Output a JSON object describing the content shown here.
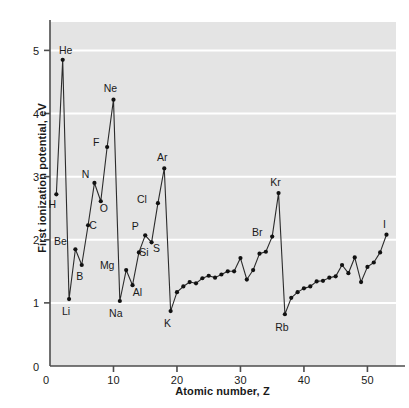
{
  "chart_data": {
    "type": "line",
    "title": "",
    "xlabel": "Atomic number, Z",
    "ylabel": "First ionization potential, eV",
    "xlim": [
      0,
      54.5
    ],
    "ylim": [
      0,
      5.45
    ],
    "xticks": [
      0,
      10,
      20,
      30,
      40,
      50
    ],
    "yticks": [
      0,
      1,
      2,
      3,
      4,
      5
    ],
    "gridlines": "horizontal-white",
    "legend": "none",
    "marker": "filled-circle",
    "x": [
      1,
      2,
      3,
      4,
      5,
      6,
      7,
      8,
      9,
      10,
      11,
      12,
      13,
      14,
      15,
      16,
      17,
      18,
      19,
      20,
      21,
      22,
      23,
      24,
      25,
      26,
      27,
      28,
      29,
      30,
      31,
      32,
      33,
      34,
      35,
      36,
      37,
      38,
      39,
      40,
      41,
      42,
      43,
      44,
      45,
      46,
      47,
      48,
      49,
      50,
      51,
      52,
      53
    ],
    "y": [
      2.72,
      4.85,
      1.06,
      1.85,
      1.6,
      2.23,
      2.9,
      2.61,
      3.47,
      4.22,
      1.03,
      1.52,
      1.28,
      1.8,
      2.07,
      1.96,
      2.58,
      3.13,
      0.87,
      1.17,
      1.26,
      1.33,
      1.31,
      1.39,
      1.43,
      1.4,
      1.45,
      1.5,
      1.5,
      1.71,
      1.37,
      1.52,
      1.78,
      1.81,
      2.05,
      2.74,
      0.82,
      1.08,
      1.17,
      1.23,
      1.26,
      1.34,
      1.35,
      1.4,
      1.42,
      1.6,
      1.47,
      1.72,
      1.33,
      1.57,
      1.64,
      1.8,
      2.08
    ],
    "labels": [
      {
        "symbol": "H",
        "z": 1,
        "value": 2.72,
        "dx": -4,
        "dy": 14
      },
      {
        "symbol": "He",
        "z": 2,
        "value": 4.85,
        "dx": 3,
        "dy": -6
      },
      {
        "symbol": "Li",
        "z": 3,
        "value": 1.06,
        "dx": -3,
        "dy": 16
      },
      {
        "symbol": "Be",
        "z": 4,
        "value": 1.85,
        "dx": -15,
        "dy": -4
      },
      {
        "symbol": "B",
        "z": 5,
        "value": 1.6,
        "dx": -2,
        "dy": 15
      },
      {
        "symbol": "C",
        "z": 6,
        "value": 2.23,
        "dx": 5,
        "dy": 4
      },
      {
        "symbol": "N",
        "z": 7,
        "value": 2.9,
        "dx": -9,
        "dy": -5
      },
      {
        "symbol": "O",
        "z": 8,
        "value": 2.61,
        "dx": 3,
        "dy": 11
      },
      {
        "symbol": "F",
        "z": 9,
        "value": 3.47,
        "dx": -11,
        "dy": -1
      },
      {
        "symbol": "Ne",
        "z": 10,
        "value": 4.22,
        "dx": -3,
        "dy": -8
      },
      {
        "symbol": "Na",
        "z": 11,
        "value": 1.03,
        "dx": -4,
        "dy": 16
      },
      {
        "symbol": "Mg",
        "z": 12,
        "value": 1.52,
        "dx": -19,
        "dy": -1
      },
      {
        "symbol": "Al",
        "z": 13,
        "value": 1.28,
        "dx": 5,
        "dy": 11
      },
      {
        "symbol": "Si",
        "z": 14,
        "value": 1.8,
        "dx": 5,
        "dy": 4
      },
      {
        "symbol": "P",
        "z": 15,
        "value": 2.07,
        "dx": -10,
        "dy": -5
      },
      {
        "symbol": "S",
        "z": 16,
        "value": 1.96,
        "dx": 5,
        "dy": 10
      },
      {
        "symbol": "Cl",
        "z": 17,
        "value": 2.58,
        "dx": -16,
        "dy": 0
      },
      {
        "symbol": "Ar",
        "z": 18,
        "value": 3.13,
        "dx": -2,
        "dy": -7
      },
      {
        "symbol": "K",
        "z": 19,
        "value": 0.87,
        "dx": -3,
        "dy": 16
      },
      {
        "symbol": "Br",
        "z": 35,
        "value": 2.05,
        "dx": -15,
        "dy": -1
      },
      {
        "symbol": "Kr",
        "z": 36,
        "value": 2.74,
        "dx": -3,
        "dy": -7
      },
      {
        "symbol": "Rb",
        "z": 37,
        "value": 0.82,
        "dx": -3,
        "dy": 17
      },
      {
        "symbol": "I",
        "z": 53,
        "value": 2.08,
        "dx": -2,
        "dy": -7
      }
    ]
  },
  "style": {
    "plot_background": "#e4e4e4",
    "gridline_color": "#ffffff",
    "line_color": "#2b2b2b",
    "marker_color": "#111111",
    "axis_color": "#4d4d4d",
    "text_color": "#1a1a1a"
  }
}
